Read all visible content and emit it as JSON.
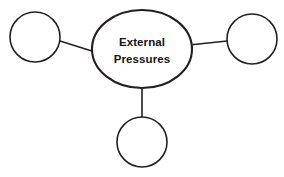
{
  "diagram": {
    "type": "hub-and-spoke",
    "background_color": "#ffffff",
    "stroke_color": "#231f20",
    "text_color": "#141414",
    "center": {
      "name": "external-pressures",
      "shape": "ellipse",
      "label_line1": "External",
      "label_line2": "Pressures",
      "cx": 142,
      "cy": 49,
      "rx": 50,
      "ry": 39,
      "stroke_width": 2.1,
      "fill": "#ffffff"
    },
    "satellites": [
      {
        "name": "satellite-left",
        "shape": "circle",
        "label": "",
        "cx": 35,
        "cy": 37,
        "r": 25,
        "stroke_width": 1.6,
        "fill": "#ffffff"
      },
      {
        "name": "satellite-right",
        "shape": "circle",
        "label": "",
        "cx": 252,
        "cy": 39,
        "r": 25,
        "stroke_width": 1.6,
        "fill": "#ffffff"
      },
      {
        "name": "satellite-bottom",
        "shape": "circle",
        "label": "",
        "cx": 142,
        "cy": 142,
        "r": 25,
        "stroke_width": 1.6,
        "fill": "#ffffff"
      }
    ],
    "connectors": [
      {
        "name": "connector-left",
        "from": "external-pressures",
        "to": "satellite-left",
        "x1": 60,
        "y1": 41,
        "x2": 95,
        "y2": 52,
        "stroke_width": 1.5
      },
      {
        "name": "connector-right",
        "from": "external-pressures",
        "to": "satellite-right",
        "x1": 189,
        "y1": 45,
        "x2": 227,
        "y2": 41,
        "stroke_width": 1.5
      },
      {
        "name": "connector-bottom",
        "from": "external-pressures",
        "to": "satellite-bottom",
        "x1": 142,
        "y1": 88,
        "x2": 142,
        "y2": 117,
        "stroke_width": 1.5
      }
    ]
  }
}
